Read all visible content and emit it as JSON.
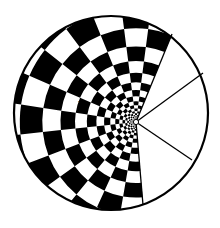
{
  "figure": {
    "type": "polar-checkerboard-diagram",
    "background": "#ffffff",
    "ink": "#000000",
    "canvas": {
      "width": 220,
      "height": 228
    },
    "outer_circle": {
      "cx": 111,
      "cy": 113,
      "r": 97,
      "stroke_width": 2.2
    },
    "apex": {
      "x": 136,
      "y": 122,
      "r": 2.6
    },
    "checker_region": {
      "start_angle_deg": 85,
      "end_angle_deg": 292.3,
      "sectors": 14,
      "inner_radius": 3,
      "ring_ratio": 1.24,
      "max_radius": 130
    },
    "wedge_lines": [
      {
        "to_x": 172,
        "to_y": 34
      },
      {
        "to_x": 203,
        "to_y": 73
      },
      {
        "to_x": 192,
        "to_y": 160
      },
      {
        "to_x": 143,
        "to_y": 205
      }
    ],
    "annotations": [
      {
        "label": "x",
        "x": 78,
        "y": 100
      }
    ]
  }
}
